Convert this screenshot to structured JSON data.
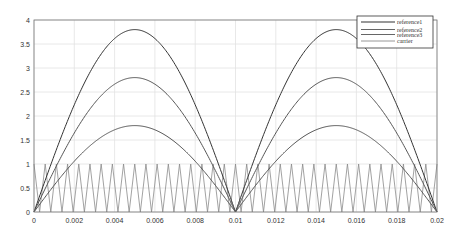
{
  "chart_data": {
    "type": "line",
    "title": "",
    "xlabel": "",
    "ylabel": "",
    "xlim": [
      0,
      0.02
    ],
    "ylim": [
      0,
      4
    ],
    "grid": true,
    "x_ticks": [
      0,
      0.002,
      0.004,
      0.006,
      0.008,
      0.01,
      0.012,
      0.014,
      0.016,
      0.018,
      0.02
    ],
    "x_tick_labels": [
      "0",
      "0.002",
      "0.004",
      "0.006",
      "0.008",
      "0.01",
      "0.012",
      "0.014",
      "0.016",
      "0.018",
      "0.02"
    ],
    "y_ticks": [
      0,
      0.5,
      1,
      1.5,
      2,
      2.5,
      3,
      3.5,
      4
    ],
    "y_tick_labels": [
      "0",
      "0.5",
      "1",
      "1.5",
      "2",
      "2.5",
      "3",
      "3.5",
      "4"
    ],
    "legend_position": "top-right",
    "series": [
      {
        "name": "reference1",
        "kind": "rectified-sine",
        "frequency_hz": 50,
        "amplitude": 3.8,
        "color": "#333333"
      },
      {
        "name": "reference2",
        "kind": "rectified-sine",
        "frequency_hz": 50,
        "amplitude": 2.8,
        "color": "#555555"
      },
      {
        "name": "reference3",
        "kind": "rectified-sine",
        "frequency_hz": 50,
        "amplitude": 1.8,
        "color": "#555555"
      },
      {
        "name": "carrier",
        "kind": "triangle",
        "frequency_hz": 1800,
        "min": 0,
        "max": 1,
        "start_value": 1,
        "color": "#8a8a8a"
      }
    ]
  }
}
